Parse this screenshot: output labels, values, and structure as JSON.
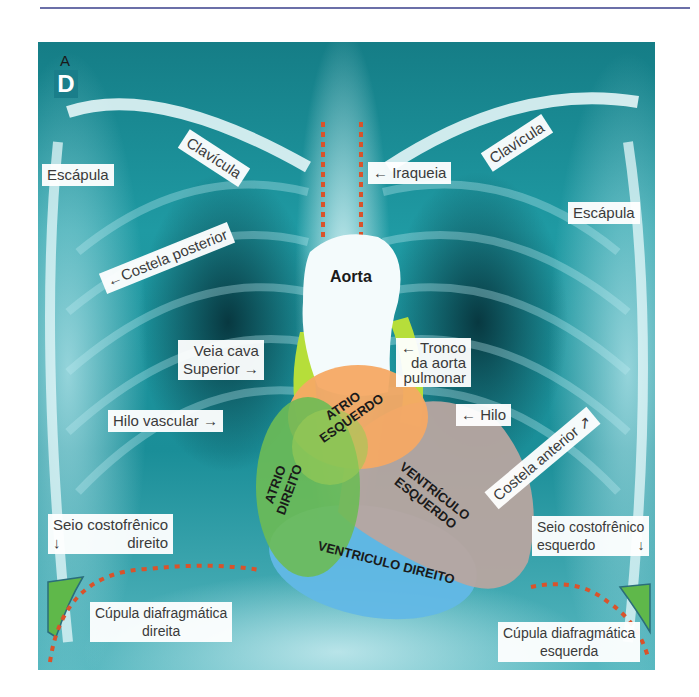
{
  "figure": {
    "orientation_badge": "D",
    "orientation_letter": "A",
    "colors": {
      "top_rule": "#6b6fa8",
      "xray_base": "#1a8e98",
      "aorta": "#f4fbfc",
      "atrio_esquerdo": "#f5a964",
      "atrio_direito": "#6dbb55",
      "ventriculo_esquerdo": "#b7a5a0",
      "ventriculo_direito": "#62b8e6",
      "vessel_green": "#b6de3a",
      "dotted_line": "#d9532b",
      "costophrenic_fill": "#5fb84a"
    },
    "labels": {
      "escapula_right": "Escápula",
      "clavicula_right": "Clavícula",
      "iraqueia": "← Iraqueia",
      "clavicula_left": "Clavícula",
      "escapula_left": "Escápula",
      "costela_posterior": "←Costela posterior",
      "veia_cava_line1": "Veia cava",
      "veia_cava_line2": "Superior →",
      "tronco_line1": "← Tronco",
      "tronco_line2": "da aorta",
      "tronco_line3": "pulmonar",
      "hilo_vascular": "Hilo vascular →",
      "hilo": "← Hilo",
      "costela_anterior": "Costela anterior ↗",
      "seio_direito_line1": "Seio costofrênico",
      "seio_direito_line2": "direito",
      "seio_direito_arrow": "↓",
      "seio_esquerdo_line1": "Seio costofrênico",
      "seio_esquerdo_line2": "esquerdo",
      "seio_esquerdo_arrow": "↓",
      "cupula_direita_line1": "Cúpula diafragmática",
      "cupula_direita_line2": "direita",
      "cupula_esquerda_line1": "Cúpula diafragmática",
      "cupula_esquerda_line2": "esquerda"
    },
    "heart": {
      "aorta": "Aorta",
      "atrio_esquerdo_line1": "ATRIO",
      "atrio_esquerdo_line2": "ESQUERDO",
      "atrio_direito_line1": "ATRIO",
      "atrio_direito_line2": "DIREITO",
      "ventriculo_esquerdo_line1": "VENTRÍCULO",
      "ventriculo_esquerdo_line2": "ESQUERDO",
      "ventriculo_direito": "VENTRICULO DIREITO"
    }
  }
}
